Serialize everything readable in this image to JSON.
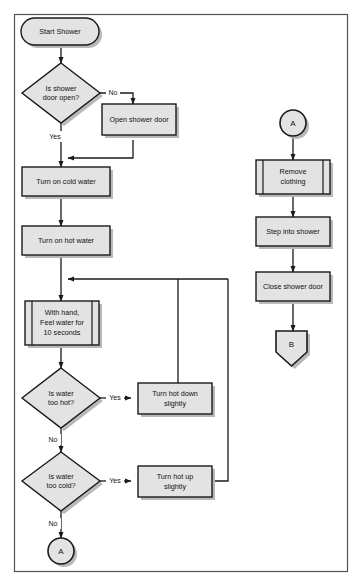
{
  "diagram": {
    "colors": {
      "shape_fill": "#e3e3e3",
      "shape_stroke": "#1a1a1a",
      "shadow": "#b9b9b9",
      "line": "#1a1a1a",
      "frame": "#555555",
      "background": "#ffffff",
      "text": "#111111"
    },
    "frame": {
      "x": 14,
      "y": 14,
      "width": 334,
      "height": 558
    },
    "nodes": {
      "start": {
        "label": "Start Shower",
        "shape": "terminator"
      },
      "decision_door": {
        "label_line1": "Is shower",
        "label_line2": "door open?",
        "shape": "decision"
      },
      "open_door": {
        "label": "Open shower door",
        "shape": "process"
      },
      "cold_water": {
        "label": "Turn on cold water",
        "shape": "process"
      },
      "hot_water": {
        "label": "Turn on hot water",
        "shape": "process"
      },
      "feel_water": {
        "label_line1": "With hand,",
        "label_line2": "Feel water for",
        "label_line3": "10 seconds",
        "shape": "predefined-process"
      },
      "decision_hot": {
        "label_line1": "Is water",
        "label_line2": "too hot?",
        "shape": "decision"
      },
      "hot_down": {
        "label_line1": "Turn hot down",
        "label_line2": "slightly",
        "shape": "process"
      },
      "decision_cold": {
        "label_line1": "Is water",
        "label_line2": "too cold?",
        "shape": "decision"
      },
      "hot_up": {
        "label_line1": "Turn hot up",
        "label_line2": "slightly",
        "shape": "process"
      },
      "connector_a_out": {
        "label": "A",
        "shape": "connector-circle"
      },
      "connector_a_in": {
        "label": "A",
        "shape": "connector-circle"
      },
      "remove_clothing": {
        "label_line1": "Remove",
        "label_line2": "clothing",
        "shape": "predefined-process"
      },
      "step_into": {
        "label": "Step into shower",
        "shape": "process"
      },
      "close_door": {
        "label": "Close shower door",
        "shape": "process"
      },
      "connector_b": {
        "label": "B",
        "shape": "offpage-connector"
      }
    },
    "edge_labels": {
      "door_no": "No",
      "door_yes": "Yes",
      "hot_yes": "Yes",
      "hot_no": "No",
      "cold_yes": "Yes",
      "cold_no": "No"
    }
  }
}
